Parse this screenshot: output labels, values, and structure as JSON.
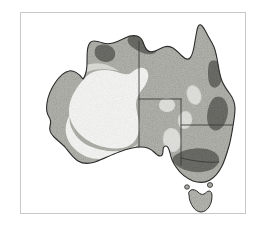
{
  "figure": {
    "title": "Australia",
    "kind": "thematic-shaded-map",
    "frame_border_color": "#c9c9c9",
    "background_color": "#ffffff",
    "outline_color": "#2b2b2b",
    "border_label": "map-frame"
  },
  "legend_scale": {
    "very_light_label": "very light zone",
    "light_label": "light zone",
    "medium_label": "medium zone",
    "dark_label": "dark zone",
    "very_light_color": "#f7f7f5",
    "light_color": "#e2e2de",
    "medium_color": "#b4b4ae",
    "dark_color": "#6f6f6a",
    "outline_color": "#2b2b2b"
  },
  "landmasses": [
    {
      "name": "mainland-australia",
      "label": "Mainland Australia"
    },
    {
      "name": "tasmania",
      "label": "Tasmania"
    },
    {
      "name": "bass-strait-island-west",
      "label": "King Island"
    },
    {
      "name": "bass-strait-island-east",
      "label": "Flinders Island"
    }
  ],
  "state_boundaries": [
    {
      "name": "wa-nt-sa-vertical-border",
      "label": "Western Australia border"
    },
    {
      "name": "nt-sa-horizontal-border",
      "label": "Northern Territory / South Australia border"
    },
    {
      "name": "qld-nsw-horizontal-border",
      "label": "Queensland / New South Wales border"
    },
    {
      "name": "sa-nsw-vertical-border",
      "label": "South Australia / New South Wales border"
    },
    {
      "name": "nsw-vic-border",
      "label": "New South Wales / Victoria border"
    }
  ],
  "shaded_zones": [
    {
      "name": "central-desert-pale-zone",
      "label": "Central arid pale zone",
      "tone": "very-light"
    },
    {
      "name": "southwest-pale-zone",
      "label": "South-western pale zone",
      "tone": "very-light"
    },
    {
      "name": "kimberley-dark-patch",
      "label": "Kimberley dark patch",
      "tone": "dark"
    },
    {
      "name": "arnhem-dark-patch",
      "label": "Arnhem Land dark patch",
      "tone": "dark"
    },
    {
      "name": "north-queensland-dark-patch",
      "label": "North Queensland coastal dark patch",
      "tone": "dark"
    },
    {
      "name": "central-queensland-dark-patch",
      "label": "Central Queensland coastal dark patch",
      "tone": "dark"
    },
    {
      "name": "murray-basin-dark-patch",
      "label": "Murray basin dark patch",
      "tone": "dark"
    },
    {
      "name": "queensland-blob-a",
      "label": "Inland pale blob A",
      "tone": "light"
    },
    {
      "name": "queensland-blob-b",
      "label": "Inland pale blob B",
      "tone": "light"
    },
    {
      "name": "queensland-blob-c",
      "label": "Inland pale blob C",
      "tone": "light"
    },
    {
      "name": "nsw-blob-d",
      "label": "Inland pale blob D",
      "tone": "light"
    }
  ],
  "caption": ""
}
